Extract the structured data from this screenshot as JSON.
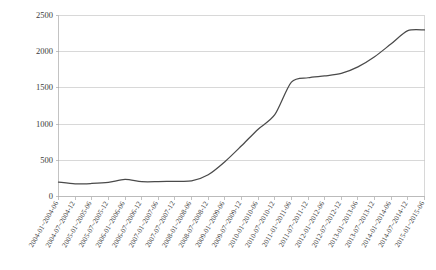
{
  "chart_data": {
    "type": "line",
    "title": "",
    "subtitle": "",
    "xlabel": "",
    "ylabel": "",
    "ylim": [
      0,
      2500
    ],
    "ytick_values": [
      0,
      500,
      1000,
      1500,
      2000,
      2500
    ],
    "ytick_labels": [
      "0",
      "500",
      "1000",
      "1500",
      "2000",
      "2500"
    ],
    "grid": true,
    "legend": "none",
    "categories": [
      "2004-01~2004-06",
      "2004-07~2004-12",
      "2005-01~2005-06",
      "2005-07~2005-12",
      "2006-01~2006-06",
      "2006-07~2006-12",
      "2007-01~2007-06",
      "2007-07~2007-12",
      "2008-01~2008-06",
      "2008-07~2008-12",
      "2009-01~2009-06",
      "2009-07~2009-12",
      "2010-01~2010-06",
      "2010-07~2010-12",
      "2011-01~2011-06",
      "2011-07~2011-12",
      "2012-01~2012-06",
      "2012-07~2012-12",
      "2013-01~2013-06",
      "2013-07~2013-12",
      "2014-01~2014-06",
      "2014-07~2014-12",
      "2015-01~2015-06"
    ],
    "series": [
      {
        "name": "series-1",
        "values": [
          200,
          175,
          180,
          195,
          235,
          205,
          205,
          210,
          215,
          300,
          480,
          700,
          930,
          1130,
          1580,
          1640,
          1665,
          1700,
          1790,
          1930,
          2110,
          2290,
          2300
        ]
      }
    ]
  },
  "style": {
    "line_color": "#4a4a4a",
    "grid_color": "#c8c8c8",
    "axis_color": "#b4b4b4",
    "text_color": "#3a3a3a",
    "background": "#ffffff"
  }
}
